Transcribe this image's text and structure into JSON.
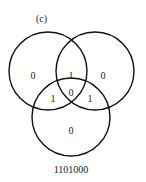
{
  "diagram": {
    "panel_label": "(c)",
    "caption": "1101000",
    "stroke_color": "#111111",
    "circles": [
      {
        "name": "left",
        "cx": 48,
        "cy": 71,
        "r": 39
      },
      {
        "name": "right",
        "cx": 95,
        "cy": 71,
        "r": 39
      },
      {
        "name": "bottom",
        "cx": 71,
        "cy": 117,
        "r": 39
      }
    ],
    "regions": {
      "left_only": "0",
      "right_only": "0",
      "bottom_only": "0",
      "left_right": "1",
      "left_bottom": "1",
      "right_bottom": "1",
      "center": "0"
    }
  }
}
